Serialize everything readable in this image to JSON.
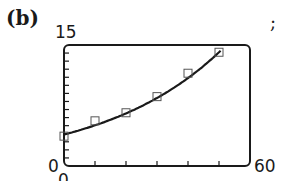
{
  "figure": {
    "part_label": "(b)",
    "trailing_punctuation": ";"
  },
  "axes": {
    "y_max_label": "15",
    "y_min_label": "0",
    "x_min_label": "0",
    "x_max_label": "60"
  },
  "colors": {
    "ink": "#1a1a1a",
    "background": "#ffffff"
  },
  "chart_data": {
    "type": "scatter",
    "title": "",
    "xlabel": "",
    "ylabel": "",
    "xlim": [
      0,
      60
    ],
    "ylim": [
      0,
      15
    ],
    "x_tick_step": 10,
    "y_tick_step": 1,
    "grid": false,
    "legend": "none",
    "series": [
      {
        "name": "data points",
        "marker": "square-open",
        "x": [
          0,
          10,
          20,
          30,
          40,
          50
        ],
        "values": [
          3.7,
          5.6,
          6.6,
          8.6,
          11.5,
          14.1
        ]
      },
      {
        "name": "fitted curve",
        "style": "line",
        "x": [
          0,
          10,
          20,
          30,
          40,
          50
        ],
        "values": [
          3.9,
          5.0,
          6.4,
          8.3,
          10.8,
          14.1
        ]
      }
    ],
    "annotations": [
      "(b)",
      ";"
    ]
  }
}
